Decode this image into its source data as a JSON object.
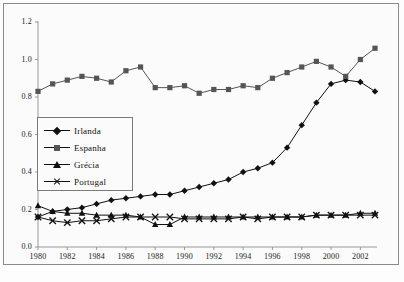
{
  "chart_data": {
    "type": "line",
    "title": "",
    "xlabel": "",
    "ylabel": "",
    "xlim": [
      1980,
      2003
    ],
    "ylim": [
      0.0,
      1.2
    ],
    "grid": false,
    "legend_position": "inside-left",
    "x": [
      1980,
      1981,
      1982,
      1983,
      1984,
      1985,
      1986,
      1987,
      1988,
      1989,
      1990,
      1991,
      1992,
      1993,
      1994,
      1995,
      1996,
      1997,
      1998,
      1999,
      2000,
      2001,
      2002,
      2003
    ],
    "xtick_labels": [
      "1980",
      "1982",
      "1984",
      "1986",
      "1988",
      "1990",
      "1992",
      "1994",
      "1996",
      "1998",
      "2000",
      "2002"
    ],
    "xticks": [
      1980,
      1982,
      1984,
      1986,
      1988,
      1990,
      1992,
      1994,
      1996,
      1998,
      2000,
      2002
    ],
    "ytick_labels": [
      "0.0",
      "0.2",
      "0.4",
      "0.6",
      "0.8",
      "1.0",
      "1.2"
    ],
    "yticks": [
      0.0,
      0.2,
      0.4,
      0.6,
      0.8,
      1.0,
      1.2
    ],
    "series": [
      {
        "name": "Irlanda",
        "marker": "diamond",
        "color": "#111111",
        "values": [
          0.16,
          0.19,
          0.2,
          0.21,
          0.23,
          0.25,
          0.26,
          0.27,
          0.28,
          0.28,
          0.3,
          0.32,
          0.34,
          0.36,
          0.4,
          0.42,
          0.45,
          0.53,
          0.65,
          0.77,
          0.87,
          0.89,
          0.88,
          0.83
        ]
      },
      {
        "name": "Espanha",
        "marker": "square",
        "color": "#555555",
        "values": [
          0.83,
          0.87,
          0.89,
          0.91,
          0.9,
          0.88,
          0.94,
          0.96,
          0.85,
          0.85,
          0.86,
          0.82,
          0.84,
          0.84,
          0.86,
          0.85,
          0.9,
          0.93,
          0.96,
          0.99,
          0.96,
          0.91,
          1.0,
          1.06
        ]
      },
      {
        "name": "Grécia",
        "marker": "triangle",
        "color": "#111111",
        "values": [
          0.22,
          0.19,
          0.18,
          0.18,
          0.17,
          0.17,
          0.17,
          0.16,
          0.12,
          0.12,
          0.16,
          0.16,
          0.16,
          0.16,
          0.16,
          0.16,
          0.16,
          0.16,
          0.16,
          0.17,
          0.17,
          0.17,
          0.18,
          0.18
        ]
      },
      {
        "name": "Portugal",
        "marker": "x",
        "color": "#111111",
        "values": [
          0.16,
          0.14,
          0.13,
          0.14,
          0.14,
          0.15,
          0.16,
          0.16,
          0.16,
          0.16,
          0.15,
          0.15,
          0.15,
          0.15,
          0.16,
          0.15,
          0.16,
          0.16,
          0.16,
          0.17,
          0.17,
          0.17,
          0.17,
          0.17
        ]
      }
    ]
  },
  "legend": {
    "items": [
      {
        "label": "Irlanda",
        "marker": "diamond"
      },
      {
        "label": "Espanha",
        "marker": "square"
      },
      {
        "label": "Grécia",
        "marker": "triangle"
      },
      {
        "label": "Portugal",
        "marker": "x"
      }
    ]
  }
}
